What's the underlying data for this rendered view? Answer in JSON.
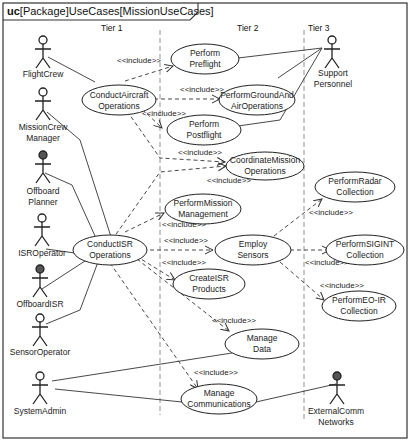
{
  "diagram": {
    "frame_kind": "uc",
    "frame_title": "[Package]UseCases[MissionUseCases]",
    "tiers": [
      "Tier 1",
      "Tier 2",
      "Tier 3"
    ],
    "include_label": "<<include>>"
  },
  "actors": [
    {
      "id": "flightcrew",
      "lines": [
        "FlightCrew"
      ],
      "dark": false
    },
    {
      "id": "missioncrew",
      "lines": [
        "MissionCrew",
        "Manager"
      ],
      "dark": false
    },
    {
      "id": "offboardplanner",
      "lines": [
        "Offboard",
        "Planner"
      ],
      "dark": true
    },
    {
      "id": "isroperator",
      "lines": [
        "ISROperator"
      ],
      "dark": false
    },
    {
      "id": "offboardisr",
      "lines": [
        "OffboardISR"
      ],
      "dark": true
    },
    {
      "id": "sensoroperator",
      "lines": [
        "SensorOperator"
      ],
      "dark": false
    },
    {
      "id": "systemadmin",
      "lines": [
        "SystemAdmin"
      ],
      "dark": false
    },
    {
      "id": "support",
      "lines": [
        "Support",
        "Personnel"
      ],
      "dark": false
    },
    {
      "id": "extcomm",
      "lines": [
        "ExternalComm",
        "Networks"
      ],
      "dark": true
    }
  ],
  "use_cases": [
    {
      "id": "conductaircraft",
      "lines": [
        "ConductAircraft",
        "Operations"
      ]
    },
    {
      "id": "preflight",
      "lines": [
        "Perform",
        "Preflight"
      ]
    },
    {
      "id": "groundair",
      "lines": [
        "PerformGroundAnd",
        "AirOperations"
      ]
    },
    {
      "id": "postflight",
      "lines": [
        "Perform",
        "Postflight"
      ]
    },
    {
      "id": "coordinate",
      "lines": [
        "CoordinateMission",
        "Operations"
      ]
    },
    {
      "id": "conductisr",
      "lines": [
        "ConductISR",
        "Operations"
      ]
    },
    {
      "id": "missionmgmt",
      "lines": [
        "PerformMission",
        "Management"
      ]
    },
    {
      "id": "employsensors",
      "lines": [
        "Employ",
        "Sensors"
      ]
    },
    {
      "id": "createisr",
      "lines": [
        "CreateISR",
        "Products"
      ]
    },
    {
      "id": "managedata",
      "lines": [
        "Manage",
        "Data"
      ]
    },
    {
      "id": "managecomms",
      "lines": [
        "Manage",
        "Communications"
      ]
    },
    {
      "id": "radar",
      "lines": [
        "PerformRadar",
        "Collection"
      ]
    },
    {
      "id": "sigint",
      "lines": [
        "PerformSIGINT",
        "Collection"
      ]
    },
    {
      "id": "eoir",
      "lines": [
        "PerformEO-IR",
        "Collection"
      ]
    }
  ]
}
